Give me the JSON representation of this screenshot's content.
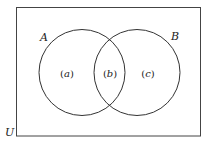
{
  "diagram": {
    "type": "venn",
    "universe": {
      "label": "U"
    },
    "sets": [
      {
        "label": "A"
      },
      {
        "label": "B"
      }
    ],
    "regions": [
      {
        "label": "(a)",
        "open": "(",
        "letter": "a",
        "close": ")"
      },
      {
        "label": "(b)",
        "open": "(",
        "letter": "b",
        "close": ")"
      },
      {
        "label": "(c)",
        "open": "(",
        "letter": "c",
        "close": ")"
      }
    ],
    "colors": {
      "stroke": "#333333",
      "background": "#ffffff"
    }
  }
}
